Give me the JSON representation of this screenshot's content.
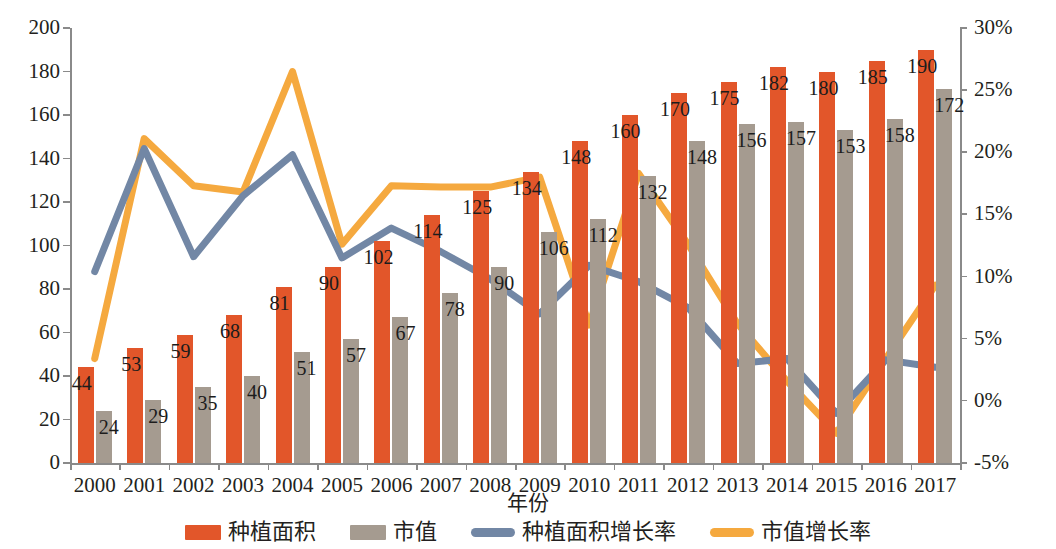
{
  "chart_data": {
    "type": "bar",
    "title": "",
    "xlabel": "年份",
    "ylabel": "",
    "categories": [
      "2000",
      "2001",
      "2002",
      "2003",
      "2004",
      "2005",
      "2006",
      "2007",
      "2008",
      "2009",
      "2010",
      "2011",
      "2012",
      "2013",
      "2014",
      "2015",
      "2016",
      "2017"
    ],
    "left_axis": {
      "ticks": [
        "0",
        "20",
        "40",
        "60",
        "80",
        "100",
        "120",
        "140",
        "160",
        "180",
        "200"
      ],
      "min": 0,
      "max": 200,
      "step": 20
    },
    "right_axis": {
      "ticks": [
        "-5%",
        "0%",
        "5%",
        "10%",
        "15%",
        "20%",
        "25%",
        "30%"
      ],
      "min": -5,
      "max": 30,
      "step": 5
    },
    "grid": false,
    "legend_position": "bottom",
    "series": [
      {
        "name": "种植面积",
        "kind": "bar",
        "axis": "left",
        "color": "#e2562a",
        "values": [
          44,
          53,
          59,
          68,
          81,
          90,
          102,
          114,
          125,
          134,
          148,
          160,
          170,
          175,
          182,
          180,
          185,
          190
        ]
      },
      {
        "name": "市值",
        "kind": "bar",
        "axis": "left",
        "color": "#a59b90",
        "values": [
          24,
          29,
          35,
          40,
          51,
          57,
          67,
          78,
          90,
          106,
          112,
          132,
          148,
          156,
          157,
          153,
          158,
          172
        ]
      },
      {
        "name": "种植面积增长率",
        "kind": "line",
        "axis": "right",
        "color": "#7287a5",
        "values": [
          10.4,
          20.3,
          11.6,
          16.5,
          19.8,
          11.5,
          13.9,
          12.0,
          9.8,
          7.0,
          10.9,
          9.6,
          7.5,
          3.0,
          3.4,
          -1.0,
          3.3,
          2.7
        ]
      },
      {
        "name": "市值增长率",
        "kind": "line",
        "axis": "right",
        "color": "#f5a93f",
        "values": [
          3.4,
          21.1,
          17.3,
          16.8,
          26.5,
          12.6,
          17.3,
          17.2,
          17.2,
          18.0,
          6.1,
          18.3,
          12.6,
          6.2,
          1.6,
          -2.6,
          3.4,
          9.3
        ]
      }
    ]
  }
}
